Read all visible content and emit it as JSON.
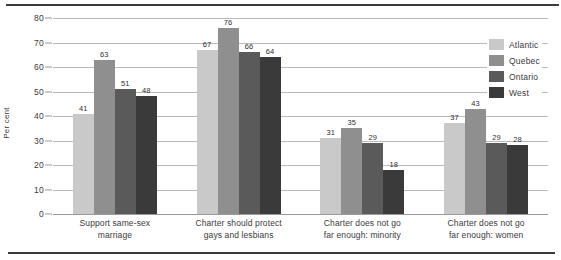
{
  "chart_data": {
    "type": "bar",
    "title": "",
    "xlabel": "",
    "ylabel": "Per cent",
    "ylim": [
      0,
      80
    ],
    "yticks": [
      0,
      10,
      20,
      30,
      40,
      50,
      60,
      70,
      80
    ],
    "grid": true,
    "legend_position": "right",
    "categories": [
      "Support same-sex marriage",
      "Charter should protect gays and lesbians",
      "Charter does not go far enough: minority",
      "Charter does not go far enough: women"
    ],
    "category_lines": [
      [
        "Support same-sex",
        "marriage"
      ],
      [
        "Charter should protect",
        "gays and lesbians"
      ],
      [
        "Charter does not go",
        "far enough: minority"
      ],
      [
        "Charter does not go",
        "far enough: women"
      ]
    ],
    "series": [
      {
        "name": "Atlantic",
        "color": "#c9c9c9",
        "values": [
          41,
          67,
          31,
          37
        ]
      },
      {
        "name": "Quebec",
        "color": "#8f8f8f",
        "values": [
          63,
          76,
          35,
          43
        ]
      },
      {
        "name": "Ontario",
        "color": "#5a5a5a",
        "values": [
          51,
          66,
          29,
          29
        ]
      },
      {
        "name": "West",
        "color": "#3a3a3a",
        "values": [
          48,
          64,
          18,
          28
        ]
      }
    ]
  },
  "legend": {
    "items": [
      {
        "label": "Atlantic"
      },
      {
        "label": "Quebec"
      },
      {
        "label": "Ontario"
      },
      {
        "label": "West"
      }
    ]
  },
  "axis": {
    "y_title": "Per cent"
  }
}
